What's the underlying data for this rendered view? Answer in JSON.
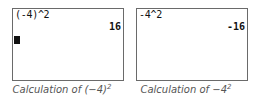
{
  "panels": [
    {
      "input": "(-4)^2",
      "result": "16",
      "show_cursor": true,
      "caption_prefix": "Calculation of ",
      "caption_base": "(−4)",
      "caption_exponent": "2"
    },
    {
      "input": "-4^2",
      "result": "-16",
      "show_cursor": false,
      "caption_prefix": "Calculation of ",
      "caption_base": "−4",
      "caption_exponent": "2"
    }
  ],
  "colors": {
    "border": "#6a6a6a",
    "text": "#111111",
    "caption": "#555555"
  }
}
